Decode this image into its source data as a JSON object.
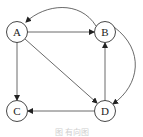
{
  "diagram": {
    "type": "directed-graph",
    "nodes": [
      {
        "id": "A",
        "label": "A",
        "cx": 17,
        "cy": 32
      },
      {
        "id": "B",
        "label": "B",
        "cx": 105,
        "cy": 32
      },
      {
        "id": "C",
        "label": "C",
        "cx": 17,
        "cy": 111
      },
      {
        "id": "D",
        "label": "D",
        "cx": 105,
        "cy": 111
      }
    ],
    "edges": [
      {
        "from": "A",
        "to": "B"
      },
      {
        "from": "B",
        "to": "A",
        "curved": true
      },
      {
        "from": "A",
        "to": "C"
      },
      {
        "from": "A",
        "to": "D"
      },
      {
        "from": "D",
        "to": "B"
      },
      {
        "from": "B",
        "to": "D",
        "curved": true
      },
      {
        "from": "D",
        "to": "C"
      }
    ],
    "caption": "图 有向图",
    "colors": {
      "stroke": "#333333",
      "background": "#ffffff",
      "caption": "#cfcfcf"
    }
  }
}
